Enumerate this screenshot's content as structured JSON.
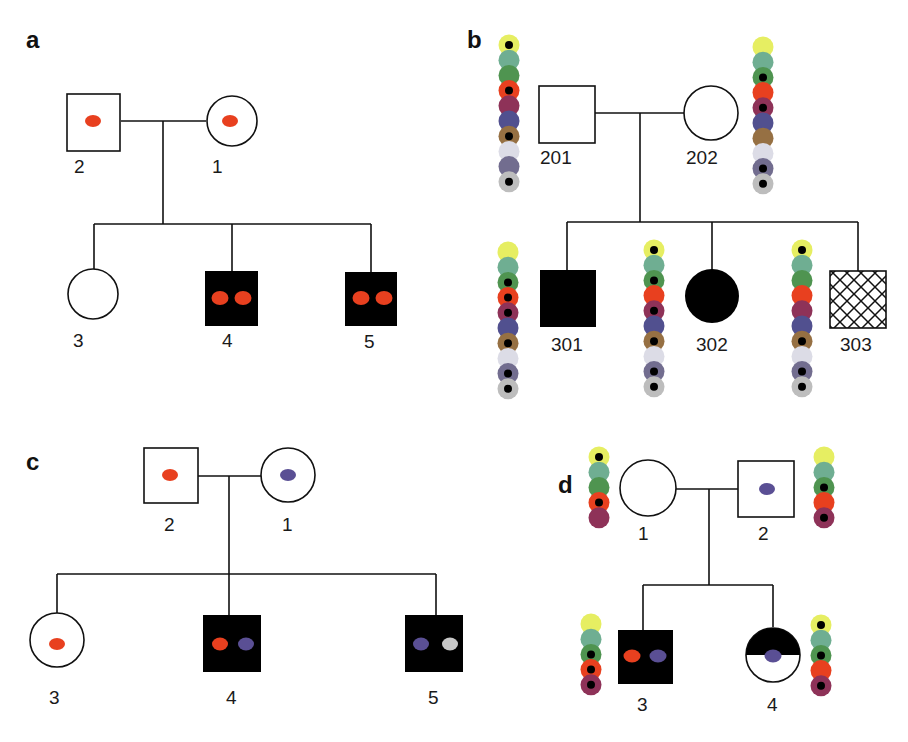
{
  "figure": {
    "marker_colors": {
      "red": "#e8401f",
      "blue": "#5a4f94",
      "grey": "#c8c8c8"
    },
    "bead_palette": [
      "#e6ee62",
      "#6fae92",
      "#4f9450",
      "#e8401f",
      "#8e3258",
      "#51508f",
      "#967043",
      "#dcdce6",
      "#726d8f",
      "#bdbdbd"
    ],
    "panels": [
      {
        "label": "a",
        "individuals": [
          {
            "id": "2",
            "sex": "male",
            "affected": false,
            "markers": [
              "red"
            ]
          },
          {
            "id": "1",
            "sex": "female",
            "affected": false,
            "markers": [
              "red"
            ]
          },
          {
            "id": "3",
            "sex": "female",
            "affected": false,
            "markers": []
          },
          {
            "id": "4",
            "sex": "male",
            "affected": true,
            "markers": [
              "red",
              "red"
            ]
          },
          {
            "id": "5",
            "sex": "male",
            "affected": true,
            "markers": [
              "red",
              "red"
            ]
          }
        ]
      },
      {
        "label": "b",
        "individuals": [
          {
            "id": "201",
            "sex": "male",
            "affected": false,
            "beads_dots": [
              1,
              0,
              0,
              1,
              0,
              0,
              1,
              0,
              0,
              1
            ]
          },
          {
            "id": "202",
            "sex": "female",
            "affected": false,
            "beads_dots": [
              0,
              0,
              1,
              0,
              1,
              0,
              0,
              0,
              1,
              1
            ]
          },
          {
            "id": "301",
            "sex": "male",
            "affected": true,
            "beads_dots": [
              0,
              0,
              1,
              1,
              1,
              0,
              1,
              0,
              1,
              1
            ]
          },
          {
            "id": "302",
            "sex": "female",
            "affected": true,
            "beads_dots": [
              1,
              0,
              1,
              0,
              1,
              0,
              1,
              0,
              1,
              1
            ]
          },
          {
            "id": "303",
            "sex": "male",
            "affected": "hatched",
            "beads_dots": [
              1,
              0,
              0,
              0,
              0,
              0,
              1,
              0,
              1,
              1
            ]
          }
        ]
      },
      {
        "label": "c",
        "individuals": [
          {
            "id": "2",
            "sex": "male",
            "affected": false,
            "markers": [
              "red"
            ]
          },
          {
            "id": "1",
            "sex": "female",
            "affected": false,
            "markers": [
              "blue"
            ]
          },
          {
            "id": "3",
            "sex": "female",
            "affected": false,
            "markers": [
              "red"
            ]
          },
          {
            "id": "4",
            "sex": "male",
            "affected": true,
            "markers": [
              "red",
              "blue"
            ]
          },
          {
            "id": "5",
            "sex": "male",
            "affected": true,
            "markers": [
              "blue",
              "grey"
            ]
          }
        ]
      },
      {
        "label": "d",
        "individuals": [
          {
            "id": "1",
            "sex": "female",
            "affected": false,
            "markers": [],
            "beads_dots": [
              1,
              0,
              0,
              1,
              0
            ]
          },
          {
            "id": "2",
            "sex": "male",
            "affected": false,
            "markers": [
              "blue"
            ],
            "beads_dots": [
              0,
              0,
              1,
              0,
              1
            ]
          },
          {
            "id": "3",
            "sex": "male",
            "affected": true,
            "markers": [
              "red",
              "blue"
            ],
            "beads_dots": [
              0,
              0,
              1,
              1,
              1
            ]
          },
          {
            "id": "4",
            "sex": "female",
            "affected": "half-top",
            "markers": [
              "blue"
            ],
            "beads_dots": [
              1,
              0,
              1,
              0,
              1
            ]
          }
        ]
      }
    ]
  }
}
